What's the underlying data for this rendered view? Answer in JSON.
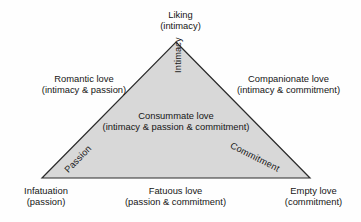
{
  "diagram": {
    "type": "triangle",
    "background_color": "#fefefe",
    "fill_color": "#d8d8d8",
    "stroke_color": "#2b2b2b",
    "geometry": {
      "apex": [
        176,
        42
      ],
      "bottom_left": [
        42,
        178
      ],
      "bottom_right": [
        310,
        178
      ]
    }
  },
  "vertices": {
    "top": {
      "name": "Liking",
      "component": "(intimacy)"
    },
    "bottom_left": {
      "name": "Infatuation",
      "component": "(passion)"
    },
    "bottom_right": {
      "name": "Empty love",
      "component": "(commitment)"
    }
  },
  "edges": {
    "left": {
      "name": "Romantic love",
      "component": "(intimacy & passion)"
    },
    "right": {
      "name": "Companionate love",
      "component": "(intimacy & commitment)"
    },
    "bottom": {
      "name": "Fatuous love",
      "component": "(passion & commitment)"
    }
  },
  "center": {
    "name": "Consummate love",
    "component": "(intimacy & passion & commitment)"
  },
  "sides": {
    "intimacy": "Intimacy",
    "passion": "Passion",
    "commitment": "Commitment"
  }
}
